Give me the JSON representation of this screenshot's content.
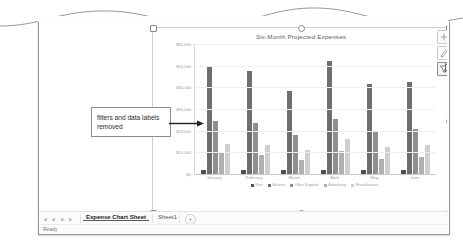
{
  "window": {
    "status_text": "Ready"
  },
  "tabbar": {
    "nav_first": "◀",
    "nav_prev": "◀",
    "nav_next": "▶",
    "nav_last": "▶",
    "add_sheet_label": "+",
    "tabs": [
      {
        "label": "Expense Chart Sheet",
        "active": true
      },
      {
        "label": "Sheet1",
        "active": false
      }
    ]
  },
  "annotation": {
    "text": "filters and data labels removed"
  },
  "chart_buttons": [
    {
      "name": "chart-elements",
      "icon": "plus-icon",
      "active": false
    },
    {
      "name": "chart-styles",
      "icon": "brush-icon",
      "active": false
    },
    {
      "name": "chart-filters",
      "icon": "funnel-icon",
      "active": true
    }
  ],
  "chart_data": {
    "type": "bar",
    "title": "Six-Month Projected Expenses",
    "xlabel": "",
    "ylabel": "",
    "ylim": [
      0,
      60000
    ],
    "grid": true,
    "legend_position": "bottom",
    "ytick_labels": [
      "$60,000",
      "$50,000",
      "$40,000",
      "$30,000",
      "$20,000",
      "$10,000",
      "$0"
    ],
    "ytick_values": [
      60000,
      50000,
      40000,
      30000,
      20000,
      10000,
      0
    ],
    "categories": [
      "January",
      "February",
      "March",
      "April",
      "May",
      "June"
    ],
    "series": [
      {
        "name": "Rent",
        "color": "#4f4f4f",
        "values": [
          1800,
          1800,
          1800,
          1800,
          1800,
          1800
        ]
      },
      {
        "name": "Salaries",
        "color": "#6e6e6e",
        "values": [
          50000,
          47500,
          38500,
          52000,
          41500,
          42500
        ]
      },
      {
        "name": "Office Supplies",
        "color": "#8f8f8f",
        "values": [
          24500,
          23500,
          18000,
          25500,
          20000,
          21000
        ]
      },
      {
        "name": "Advertising",
        "color": "#b0b0b0",
        "values": [
          9500,
          9000,
          6500,
          10500,
          7000,
          8000
        ]
      },
      {
        "name": "Miscellaneous",
        "color": "#cfcfcf",
        "values": [
          14000,
          13500,
          11000,
          16000,
          12500,
          13500
        ]
      }
    ]
  }
}
